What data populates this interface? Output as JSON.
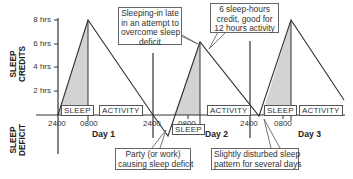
{
  "axes": {
    "y_top_title_line1": "SLEEP",
    "y_top_title_line2": "CREDITS",
    "y_bottom_title_line1": "SLEEP",
    "y_bottom_title_line2": "DEFICIT",
    "y_ticks": [
      "8 hrs",
      "6 hrs",
      "4 hrs",
      "2 hrs"
    ],
    "x_ticks": [
      "2400",
      "0800",
      "2400",
      "0800",
      "2400",
      "0800"
    ]
  },
  "days": [
    "Day 1",
    "Day 2",
    "Day 3"
  ],
  "segments": [
    {
      "label": "SLEEP",
      "day": 1
    },
    {
      "label": "ACTIVITY",
      "day": 1
    },
    {
      "label": "SLEEP",
      "day": 2
    },
    {
      "label": "ACTIVITY",
      "day": 2
    },
    {
      "label": "SLEEP",
      "day": 3
    },
    {
      "label": "ACTIVITY",
      "day": 3
    }
  ],
  "callouts": [
    {
      "lines": [
        "Sleeping-in late",
        "in an attempt to",
        "overcome sleep",
        "deficit"
      ]
    },
    {
      "lines": [
        "6 sleep-hours",
        "credit, good for",
        "12 hours activity"
      ]
    },
    {
      "lines": [
        "Party (or work)",
        "causing sleep deficit"
      ]
    },
    {
      "lines": [
        "Slightly disturbed sleep",
        "pattern for several days"
      ]
    }
  ],
  "colors": {
    "line": "#333333",
    "fill": "#d3d3d3",
    "box_border": "#666666"
  }
}
